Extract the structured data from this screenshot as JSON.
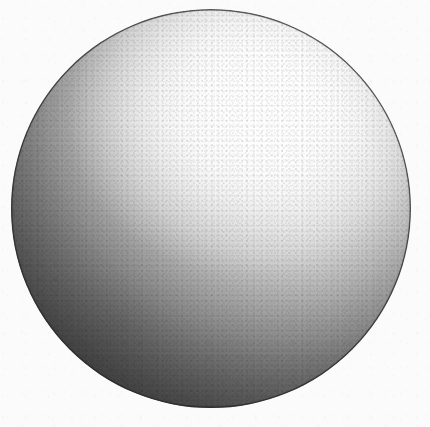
{
  "image": {
    "title": "Shaded Sphere",
    "subject": "sphere",
    "medium": "graphite pencil / airbrush shading on paper",
    "palette": "grayscale",
    "width": 430,
    "height": 427,
    "alt_text": "A grayscale shaded sphere rendered with a smooth gradient, lit from the upper right, with a dark crescent of shadow along the lower-left limb and visible paper grain."
  },
  "background": {
    "name": "paper",
    "color": "#fbfbfb",
    "texture": "fine paper grain"
  },
  "sphere": {
    "name": "sphere",
    "shape": "circle",
    "center_x": 211,
    "center_y": 208,
    "radius": 200,
    "left": 11,
    "top": 9,
    "diameter": 400,
    "outline_color": "#282828",
    "outline_width_px": 1.4
  },
  "lighting": {
    "direction": "upper-right",
    "highlight_x_pct": 62,
    "highlight_y_pct": 29,
    "highlight_color": "#ffffff",
    "midtone_color": "#a6a6a6",
    "shadow_color": "#3d3d3d",
    "terminator": "lower-left"
  },
  "tone_stops": [
    {
      "label": "highlight",
      "position_pct": 0,
      "color": "#ffffff"
    },
    {
      "label": "light",
      "position_pct": 27,
      "color": "#efefef"
    },
    {
      "label": "light-mid",
      "position_pct": 41,
      "color": "#d0d0d0"
    },
    {
      "label": "midtone",
      "position_pct": 55,
      "color": "#a6a6a6"
    },
    {
      "label": "mid-dark",
      "position_pct": 69,
      "color": "#7b7b7b"
    },
    {
      "label": "shadow",
      "position_pct": 83,
      "color": "#585858"
    },
    {
      "label": "core-shadow",
      "position_pct": 100,
      "color": "#3d3d3d"
    }
  ]
}
